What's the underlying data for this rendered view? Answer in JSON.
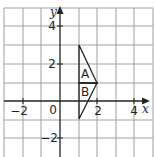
{
  "diagram": {
    "type": "coordinate-grid",
    "axes": {
      "x_label": "x",
      "y_label": "y"
    },
    "x_ticks": [
      "−2",
      "0",
      "2",
      "4"
    ],
    "y_ticks": [
      "4",
      "2",
      "−2"
    ],
    "shapes": {
      "triangle_A": {
        "label": "A",
        "vertices": [
          [
            1,
            3
          ],
          [
            2,
            1
          ],
          [
            1,
            1
          ]
        ]
      },
      "triangle_B": {
        "label": "B",
        "vertices": [
          [
            1,
            1
          ],
          [
            2,
            1
          ],
          [
            1,
            -1
          ]
        ]
      }
    },
    "colors": {
      "grid": "#9a9a9a",
      "axis": "#222222",
      "shape": "#222222"
    }
  }
}
